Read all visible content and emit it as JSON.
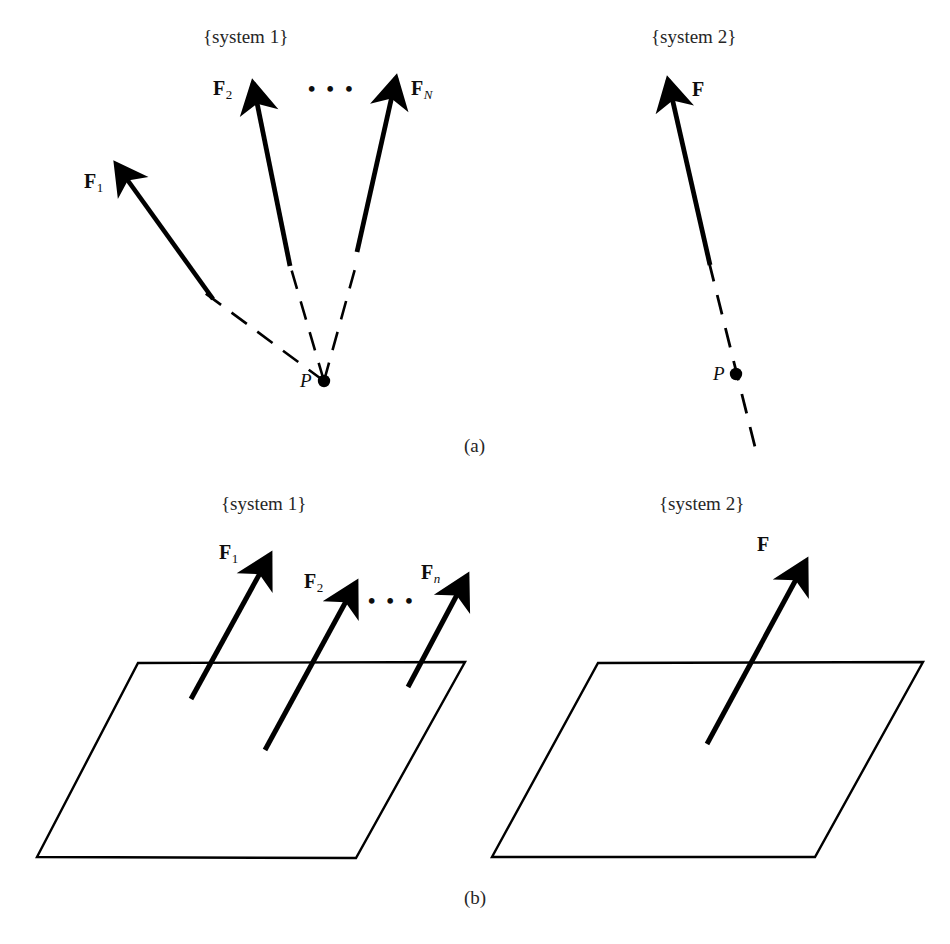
{
  "figure": {
    "background_color": "#ffffff",
    "ink_color": "#000000",
    "panels": [
      {
        "id": "a",
        "caption": "(a)",
        "subpanels": [
          {
            "id": "a-system-1",
            "title": "{system 1}",
            "point_label": "P",
            "ellipsis": "• • •",
            "forces": [
              {
                "name": "F1",
                "label_base": "F",
                "label_sub": "1"
              },
              {
                "name": "F2",
                "label_base": "F",
                "label_sub": "2"
              },
              {
                "name": "FN",
                "label_base": "F",
                "label_sub": "N"
              }
            ]
          },
          {
            "id": "a-system-2",
            "title": "{system 2}",
            "point_label": "P",
            "forces": [
              {
                "name": "F",
                "label_base": "F",
                "label_sub": ""
              }
            ]
          }
        ]
      },
      {
        "id": "b",
        "caption": "(b)",
        "subpanels": [
          {
            "id": "b-system-1",
            "title": "{system 1}",
            "ellipsis": "• • •",
            "forces": [
              {
                "name": "F1",
                "label_base": "F",
                "label_sub": "1"
              },
              {
                "name": "F2",
                "label_base": "F",
                "label_sub": "2"
              },
              {
                "name": "Fn",
                "label_base": "F",
                "label_sub": "n"
              }
            ]
          },
          {
            "id": "b-system-2",
            "title": "{system 2}",
            "forces": [
              {
                "name": "F",
                "label_base": "F",
                "label_sub": ""
              }
            ]
          }
        ]
      }
    ]
  },
  "labels": {
    "system1_a": "{system 1}",
    "system2_a": "{system 2}",
    "system1_b": "{system 1}",
    "system2_b": "{system 2}",
    "caption_a": "(a)",
    "caption_b": "(b)",
    "point_P_a1": "P",
    "point_P_a2": "P",
    "ellipsis_a": "• • •",
    "ellipsis_b": "• • •",
    "F": "F",
    "sub_1": "1",
    "sub_2": "2",
    "sub_N": "N",
    "sub_n": "n"
  },
  "ghost": {
    "bottom_strip": "        "
  }
}
